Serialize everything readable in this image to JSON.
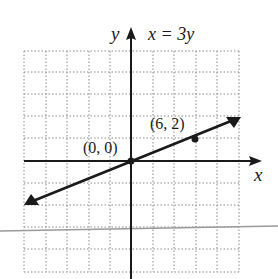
{
  "figure": {
    "equation_label": "x = 3y",
    "x_axis_label": "x",
    "y_axis_label": "y",
    "points": [
      {
        "label": "(0, 0)",
        "x": 0,
        "y": 0
      },
      {
        "label": "(6, 2)",
        "x": 6,
        "y": 2
      }
    ],
    "grid": {
      "style": "dotted",
      "x_range": [
        -10,
        10
      ],
      "y_range": [
        -10,
        10
      ],
      "grid_step": 2,
      "tick_labels_shown": false
    },
    "line": {
      "equation": "x = 3y",
      "slope": 0.3333,
      "intercept": 0,
      "arrows_both_ends": true
    },
    "colors": {
      "ink": "#1a1a1a",
      "grid": "#8a8a8a",
      "scan_line": "#9a9a9a",
      "background": "#ffffff"
    }
  }
}
